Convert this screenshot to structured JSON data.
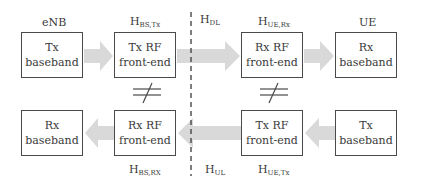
{
  "diagram": {
    "top_row": {
      "enb_label": "eNB",
      "ue_label": "UE",
      "tx_baseband": {
        "line1": "Tx",
        "line2": "baseband"
      },
      "tx_rf": {
        "line1": "Tx RF",
        "line2": "front-end",
        "channel_label": "H",
        "channel_sub": "BS,Tx"
      },
      "rx_rf": {
        "line1": "Rx RF",
        "line2": "front-end",
        "channel_label": "H",
        "channel_sub": "UE,Rx"
      },
      "rx_baseband": {
        "line1": "Rx",
        "line2": "baseband"
      }
    },
    "bottom_row": {
      "rx_baseband": {
        "line1": "Rx",
        "line2": "baseband"
      },
      "rx_rf": {
        "line1": "Rx RF",
        "line2": "front-end",
        "channel_label": "H",
        "channel_sub": "BS,RX"
      },
      "tx_rf": {
        "line1": "Tx RF",
        "line2": "front-end",
        "channel_label": "H",
        "channel_sub": "UE,Tx"
      },
      "tx_baseband": {
        "line1": "Tx",
        "line2": "baseband"
      }
    },
    "downlink": {
      "label": "H",
      "sub": "DL"
    },
    "uplink": {
      "label": "H",
      "sub": "UL"
    },
    "colors": {
      "arrow": "#d9d9d9",
      "box_border": "#4a4a4a",
      "text": "#3a3a3a",
      "dashed_line": "#3a3a3a"
    }
  }
}
